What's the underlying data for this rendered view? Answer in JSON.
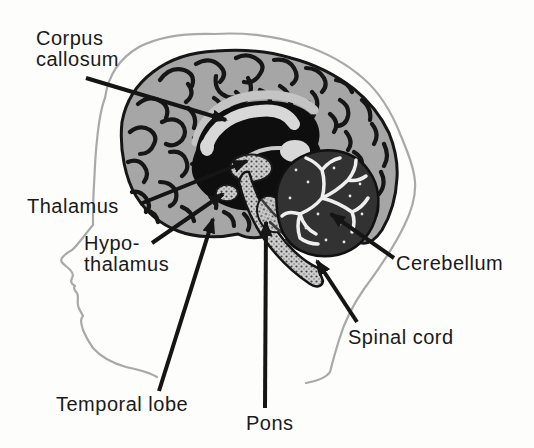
{
  "diagram": {
    "labels": [
      {
        "id": "corpus-callosum",
        "lines": [
          "Corpus",
          "callosum"
        ],
        "x": 36,
        "y": 28,
        "arrow": {
          "x1": 86,
          "y1": 78,
          "x2": 226,
          "y2": 120
        }
      },
      {
        "id": "thalamus",
        "lines": [
          "Thalamus"
        ],
        "x": 27,
        "y": 196,
        "arrow": {
          "x1": 140,
          "y1": 204,
          "x2": 247,
          "y2": 161
        }
      },
      {
        "id": "hypothalamus",
        "lines": [
          "Hypo-",
          "thalamus"
        ],
        "x": 84,
        "y": 233,
        "arrow": {
          "x1": 152,
          "y1": 243,
          "x2": 223,
          "y2": 194
        }
      },
      {
        "id": "temporal-lobe",
        "lines": [
          "Temporal lobe"
        ],
        "x": 56,
        "y": 394,
        "arrow": {
          "x1": 159,
          "y1": 391,
          "x2": 213,
          "y2": 219
        }
      },
      {
        "id": "pons",
        "lines": [
          "Pons"
        ],
        "x": 246,
        "y": 413,
        "arrow": {
          "x1": 265,
          "y1": 408,
          "x2": 266,
          "y2": 222
        }
      },
      {
        "id": "spinal-cord",
        "lines": [
          "Spinal cord"
        ],
        "x": 348,
        "y": 327,
        "arrow": {
          "x1": 357,
          "y1": 322,
          "x2": 317,
          "y2": 261
        }
      },
      {
        "id": "cerebellum",
        "lines": [
          "Cerebellum"
        ],
        "x": 396,
        "y": 253,
        "arrow": {
          "x1": 394,
          "y1": 258,
          "x2": 331,
          "y2": 214
        }
      }
    ],
    "colors": {
      "label_text": "#1a1a1a",
      "arrow": "#151515",
      "head_outline": "#a9a9a9",
      "cortex": "#a6a6a6",
      "sulci": "#161616",
      "deep_region": "#0e0e0e",
      "corpus_callosum": "#d8d8d8",
      "cingulate": "#c4c4c4",
      "stipple_base": "#cdcdcd",
      "cerebellum_dark": "#323232",
      "cerebellum_tree": "#efefef",
      "background": "#fdfdfc"
    }
  }
}
